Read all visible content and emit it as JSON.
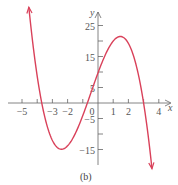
{
  "chart_data": {
    "type": "line",
    "title": "",
    "caption": "(b)",
    "xlabel": "x",
    "ylabel": "y",
    "xlim": [
      -5.5,
      4.7
    ],
    "ylim": [
      -18,
      28
    ],
    "x_ticks": [
      -5,
      -4,
      -3,
      -2,
      -1,
      1,
      2,
      3,
      4
    ],
    "x_tick_labels": [
      {
        "value": -5,
        "label": "−5"
      },
      {
        "value": -3,
        "label": "−3"
      },
      {
        "value": -2,
        "label": "−2"
      },
      {
        "value": 0,
        "label": "0"
      },
      {
        "value": 1,
        "label": "1"
      },
      {
        "value": 2,
        "label": "2"
      },
      {
        "value": 4,
        "label": "4"
      }
    ],
    "y_ticks": [
      -15,
      -10,
      -5,
      5,
      10,
      15,
      20,
      25
    ],
    "y_tick_labels": [
      {
        "value": 25,
        "label": "25"
      },
      {
        "value": 15,
        "label": "15"
      },
      {
        "value": 5,
        "label": "5"
      },
      {
        "value": -5,
        "label": "−5"
      },
      {
        "value": -15,
        "label": "−15"
      }
    ],
    "grid": false,
    "series": [
      {
        "name": "cubic",
        "color": "#d9415a",
        "function": "-1.25*(x+3.7)*(x+0.7)*(x-3)",
        "roots": [
          -3.7,
          -0.7,
          3
        ],
        "local_max": [
          1.3,
          21
        ],
        "local_min": [
          -2.6,
          -12
        ],
        "x_range": [
          -4.55,
          3.55
        ],
        "arrows": "both"
      }
    ]
  }
}
